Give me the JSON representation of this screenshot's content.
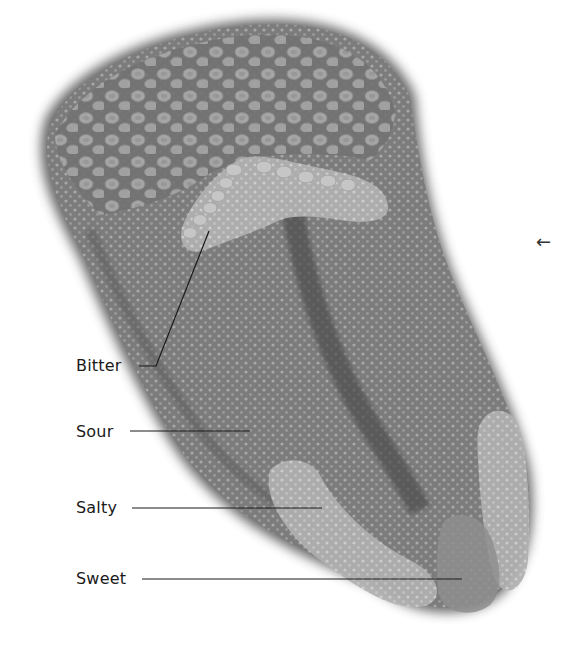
{
  "diagram": {
    "colors": {
      "background": "#ffffff",
      "tongue_dark": "#6e6e6e",
      "tongue_mid": "#8a8a8a",
      "zone_light": "#b4b4b4",
      "papillae": "#c8c8c8",
      "leader_line": "#1a1a1a",
      "label_text": "#1a1a1a"
    },
    "labels": [
      {
        "id": "bitter",
        "text": "Bitter"
      },
      {
        "id": "sour",
        "text": "Sour"
      },
      {
        "id": "salty",
        "text": "Salty"
      },
      {
        "id": "sweet",
        "text": "Sweet"
      }
    ],
    "nav_arrow": "←"
  }
}
